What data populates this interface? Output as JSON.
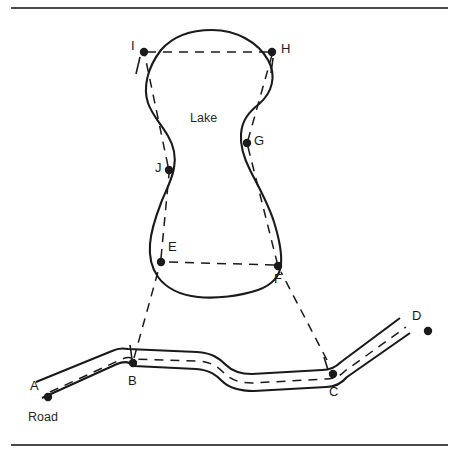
{
  "figure": {
    "kind": "survey-diagram",
    "title_labels": {
      "lake": "Lake",
      "road": "Road"
    },
    "colors": {
      "ink": "#1a1a1a",
      "rule": "#4a4a4a",
      "background": "#ffffff",
      "dashed": "#1a1a1a"
    },
    "rules": {
      "top_label": "top-horizontal-rule",
      "bottom_label": "bottom-horizontal-rule"
    },
    "points": [
      {
        "id": "A",
        "label": "A",
        "x": 48,
        "y": 397,
        "label_x": 30,
        "label_y": 379,
        "role": "road-endpoint"
      },
      {
        "id": "B",
        "label": "B",
        "x": 133,
        "y": 363,
        "label_x": 128,
        "label_y": 374,
        "role": "road-station"
      },
      {
        "id": "C",
        "label": "C",
        "x": 333,
        "y": 374,
        "label_x": 329,
        "label_y": 385,
        "role": "road-station"
      },
      {
        "id": "D",
        "label": "D",
        "x": 428,
        "y": 331,
        "label_x": 412,
        "label_y": 309,
        "role": "road-endpoint"
      },
      {
        "id": "E",
        "label": "E",
        "x": 161,
        "y": 262,
        "label_x": 168,
        "label_y": 240,
        "role": "lake-station"
      },
      {
        "id": "F",
        "label": "F",
        "x": 278,
        "y": 266,
        "label_x": 274,
        "label_y": 272,
        "role": "lake-station"
      },
      {
        "id": "G",
        "label": "G",
        "x": 247,
        "y": 143,
        "label_x": 254,
        "label_y": 134,
        "role": "lake-station"
      },
      {
        "id": "H",
        "label": "H",
        "x": 272,
        "y": 52,
        "label_x": 281,
        "label_y": 42,
        "role": "lake-station"
      },
      {
        "id": "I",
        "label": "I",
        "x": 144,
        "y": 52,
        "label_x": 131,
        "label_y": 39,
        "role": "lake-station"
      },
      {
        "id": "J",
        "label": "J",
        "x": 169,
        "y": 170,
        "label_x": 155,
        "label_y": 161,
        "role": "lake-station"
      }
    ],
    "labels": {
      "lake": {
        "text": "Lake",
        "x": 190,
        "y": 112
      },
      "road": {
        "text": "Road",
        "x": 28,
        "y": 411
      }
    },
    "traverse_segments": [
      {
        "from": "I",
        "to": "H"
      },
      {
        "from": "E",
        "to": "F"
      },
      {
        "from": "B",
        "to": "E"
      },
      {
        "from": "C",
        "to": "F"
      }
    ]
  }
}
